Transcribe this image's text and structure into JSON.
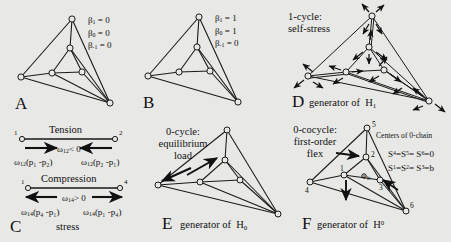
{
  "figure": {
    "background": "#e8e8e6",
    "ink": "#111111"
  },
  "panels": {
    "A": {
      "letter": "A",
      "betti": [
        "β₁ = 0",
        "β₀ = 0",
        "β₋₁ = 0"
      ],
      "beta_1_label": "β",
      "beta_1_sub": "1",
      "beta_1_val": "= 0",
      "beta_0_sub": "0",
      "beta_0_val": "= 0",
      "beta_m1_sub": "-1",
      "beta_m1_val": "= 0"
    },
    "B": {
      "letter": "B",
      "beta_1_sub": "1",
      "beta_1_val": "= 1",
      "beta_0_sub": "0",
      "beta_0_val": "= 1",
      "beta_m1_sub": "-1",
      "beta_m1_val": "= 0"
    },
    "C": {
      "letter": "C",
      "caption": "stress",
      "tension": {
        "title": "Tension",
        "node_left": "1",
        "node_right": "2",
        "condition_w": "ω",
        "condition_sub": "12",
        "condition_rel": "< 0",
        "formula_left_w": "ω",
        "formula_left_sub": "12",
        "formula_left_body": "(p₁ -p₂)",
        "formula_right_w": "ω",
        "formula_right_sub": "12",
        "formula_right_body": "(p₂ -p₁)"
      },
      "compression": {
        "title": "Compression",
        "node_left": "1",
        "node_right": "4",
        "condition_w": "ω",
        "condition_sub": "14",
        "condition_rel": "> 0",
        "formula_left_w": "ω",
        "formula_left_sub": "14",
        "formula_left_body": "(p₄ -p₁)",
        "formula_right_w": "ω",
        "formula_right_sub": "14",
        "formula_right_body": "(p₁ -p₄)"
      }
    },
    "D": {
      "letter": "D",
      "title_line1": "1-cycle:",
      "title_line2": "self-stress",
      "caption": "generator of",
      "caption_h": "H",
      "caption_h_sub": "1"
    },
    "E": {
      "letter": "E",
      "title_line1": "0-cycle:",
      "title_line2": "equilibrium",
      "title_line3": "load",
      "caption": "generator of",
      "caption_h": "H",
      "caption_h_sub": "0"
    },
    "F": {
      "letter": "F",
      "title_line1": "0-cocycle:",
      "title_line2": "first-order",
      "title_line3": "flex",
      "centers_label": "Centers of 0-chain",
      "eq_line1_a": "S",
      "eq_line1_a_sup": "4",
      "eq_line1_b": "=S",
      "eq_line1_b_sup": "5",
      "eq_line1_c": "= S",
      "eq_line1_c_sup": "6",
      "eq_line1_d": "=0",
      "eq_line2_a": "S",
      "eq_line2_a_sup": "1",
      "eq_line2_b": "=S",
      "eq_line2_b_sup": "2",
      "eq_line2_c": "= S",
      "eq_line2_c_sup": "3",
      "eq_line2_d": "=b",
      "caption": "generator of",
      "caption_h": "H",
      "caption_h_sup": "0",
      "vertices": [
        "1",
        "2",
        "3",
        "4",
        "5",
        "6"
      ],
      "center_marker": "b"
    }
  }
}
